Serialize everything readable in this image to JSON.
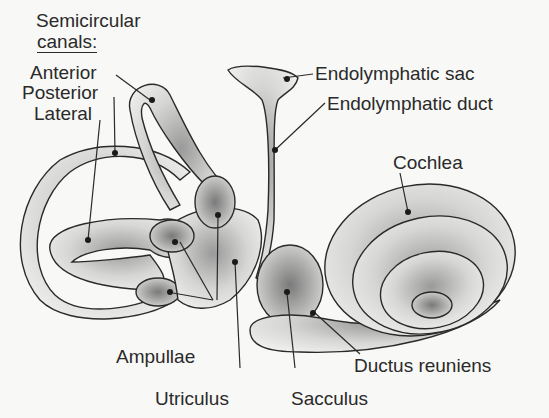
{
  "diagram": {
    "labels": {
      "semicircular_title": "Semicircular",
      "semicircular_sub": "canals:",
      "anterior": "Anterior",
      "posterior": "Posterior",
      "lateral": "Lateral",
      "endolymphatic_sac": "Endolymphatic sac",
      "endolymphatic_duct": "Endolymphatic duct",
      "cochlea": "Cochlea",
      "ampullae": "Ampullae",
      "utriculus": "Utriculus",
      "sacculus": "Sacculus",
      "ductus_reuniens": "Ductus reuniens"
    },
    "colors": {
      "ink": "#2a2a2a",
      "background": "#f8f8f6",
      "stipple": "#555555"
    }
  }
}
